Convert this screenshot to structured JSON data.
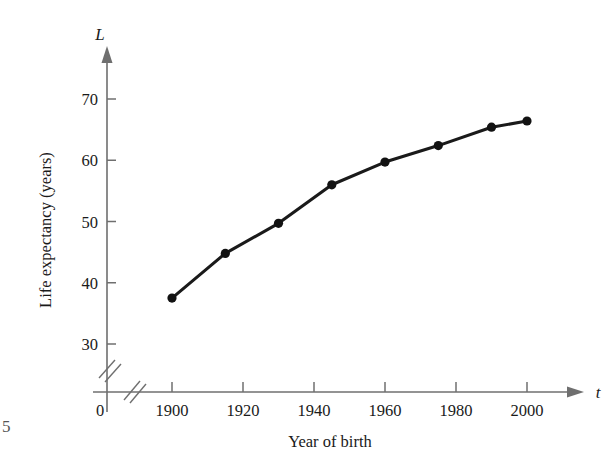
{
  "figure": {
    "page_margin_mark": "5",
    "y_axis_variable": "L",
    "x_axis_variable": "t",
    "y_axis_title": "Life expectancy (years)",
    "x_axis_title": "Year of birth",
    "origin_label": "0"
  },
  "chart_data": {
    "type": "line",
    "title": "",
    "subtitle": "",
    "xlabel": "Year of birth",
    "ylabel": "Life expectancy (years)",
    "x_variable": "t",
    "y_variable": "L",
    "x": [
      1900,
      1915,
      1930,
      1945,
      1960,
      1975,
      1990,
      2000
    ],
    "values": [
      37.5,
      44.8,
      49.7,
      56.0,
      59.7,
      62.4,
      65.4,
      66.4
    ],
    "points": [
      {
        "x": 1900,
        "y": 37.5
      },
      {
        "x": 1915,
        "y": 44.8
      },
      {
        "x": 1930,
        "y": 49.7
      },
      {
        "x": 1945,
        "y": 56.0
      },
      {
        "x": 1960,
        "y": 59.7
      },
      {
        "x": 1975,
        "y": 62.4
      },
      {
        "x": 1990,
        "y": 65.4
      },
      {
        "x": 2000,
        "y": 66.4
      }
    ],
    "xticks": [
      1900,
      1920,
      1940,
      1960,
      1980,
      2000
    ],
    "xtick_labels": [
      "1900",
      "1920",
      "1940",
      "1960",
      "1980",
      "2000"
    ],
    "yticks": [
      30,
      40,
      50,
      60,
      70
    ],
    "ytick_labels": [
      "30",
      "40",
      "50",
      "60",
      "70"
    ],
    "xlim": [
      1893,
      2010
    ],
    "ylim": [
      26,
      74
    ],
    "grid": false,
    "legend": null,
    "axis_break_x": true,
    "axis_break_y": true,
    "marker": "filled-circle",
    "line_color": "#121212",
    "axis_color": "#6f6f6f"
  }
}
